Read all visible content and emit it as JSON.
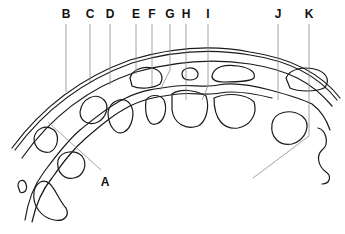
{
  "figure": {
    "type": "anatomical cross-section line drawing",
    "labels": [
      {
        "id": "A",
        "text": "A",
        "x": 105,
        "y": 176
      },
      {
        "id": "B",
        "text": "B",
        "x": 66,
        "y": 8
      },
      {
        "id": "C",
        "text": "C",
        "x": 90,
        "y": 8
      },
      {
        "id": "D",
        "text": "D",
        "x": 110,
        "y": 8
      },
      {
        "id": "E",
        "text": "E",
        "x": 136,
        "y": 8
      },
      {
        "id": "F",
        "text": "F",
        "x": 152,
        "y": 8
      },
      {
        "id": "G",
        "text": "G",
        "x": 170,
        "y": 8
      },
      {
        "id": "H",
        "text": "H",
        "x": 186,
        "y": 8
      },
      {
        "id": "I",
        "text": "I",
        "x": 208,
        "y": 8
      },
      {
        "id": "J",
        "text": "J",
        "x": 278,
        "y": 8
      },
      {
        "id": "K",
        "text": "K",
        "x": 309,
        "y": 8
      }
    ],
    "colors": {
      "stroke": "#1a1a1a",
      "leader": "#8a8a8a",
      "background": "#ffffff"
    }
  }
}
